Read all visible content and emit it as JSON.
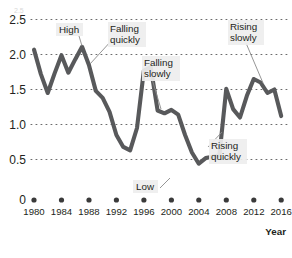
{
  "chart_data": {
    "type": "line",
    "title": "",
    "xlabel": "Year",
    "ylabel": "",
    "grid": "horizontal-dotted",
    "legend": "none",
    "xlim": [
      1979,
      2017
    ],
    "ylim": [
      0,
      2.5
    ],
    "ytick_labels": [
      "2.5",
      "2.0",
      "1.5",
      "1.0",
      "0.5",
      "0"
    ],
    "ytick_values": [
      2.5,
      2.0,
      1.5,
      1.0,
      0.5,
      0
    ],
    "xtick_labels": [
      "1980",
      "1984",
      "1988",
      "1992",
      "1996",
      "2000",
      "2004",
      "2008",
      "2012",
      "2016"
    ],
    "xtick_values": [
      1980,
      1984,
      1988,
      1992,
      1996,
      2000,
      2004,
      2008,
      2012,
      2016
    ],
    "line_color": "#58595b",
    "series": [
      {
        "name": "value",
        "x": [
          1980,
          1981,
          1982,
          1983,
          1984,
          1985,
          1986,
          1987,
          1988,
          1989,
          1990,
          1991,
          1992,
          1993,
          1994,
          1995,
          1996,
          1997,
          1998,
          1999,
          2000,
          2001,
          2002,
          2003,
          2004,
          2005,
          2006,
          2007,
          2008,
          2009,
          2010,
          2011,
          2012,
          2013,
          2014,
          2015,
          2016
        ],
        "values": [
          2.07,
          1.72,
          1.45,
          1.73,
          1.99,
          1.74,
          1.93,
          2.11,
          1.85,
          1.48,
          1.38,
          1.18,
          0.85,
          0.68,
          0.63,
          0.95,
          1.77,
          1.82,
          1.2,
          1.16,
          1.21,
          1.14,
          0.85,
          0.6,
          0.44,
          0.52,
          0.54,
          0.56,
          1.51,
          1.22,
          1.1,
          1.41,
          1.65,
          1.6,
          1.45,
          1.5,
          1.12
        ]
      }
    ],
    "annotations": [
      {
        "label": "High",
        "target_year": 1987,
        "target_value": 2.11
      },
      {
        "label": "Falling\nquickly",
        "line1": "Falling",
        "line2": "quickly",
        "target_year": 1988.6,
        "target_value": 1.71
      },
      {
        "label": "Falling\nslowly",
        "line1": "Falling",
        "line2": "slowly",
        "target_year": 1999.2,
        "target_value": 1.18
      },
      {
        "label": "Rising\nslowly",
        "line1": "Rising",
        "line2": "slowly",
        "target_year": 2014,
        "target_value": 1.45
      },
      {
        "label": "Rising\nquickly",
        "line1": "Rising",
        "line2": "quickly",
        "target_year": 2007.4,
        "target_value": 1.0
      },
      {
        "label": "Low",
        "target_year": 2004.2,
        "target_value": 0.45
      }
    ]
  },
  "axis": {
    "y_labels": [
      "2.5",
      "2.0",
      "1.5",
      "1.0",
      "0.5",
      "0"
    ],
    "x_labels": [
      "1980",
      "1984",
      "1988",
      "1992",
      "1996",
      "2000",
      "2004",
      "2008",
      "2012",
      "2016"
    ],
    "x_axis_title": "Year"
  },
  "annotations": {
    "high": "High",
    "falling_quickly_l1": "Falling",
    "falling_quickly_l2": "quickly",
    "falling_slowly_l1": "Falling",
    "falling_slowly_l2": "slowly",
    "rising_slowly_l1": "Rising",
    "rising_slowly_l2": "slowly",
    "rising_quickly_l1": "Rising",
    "rising_quickly_l2": "quickly",
    "low": "Low"
  }
}
